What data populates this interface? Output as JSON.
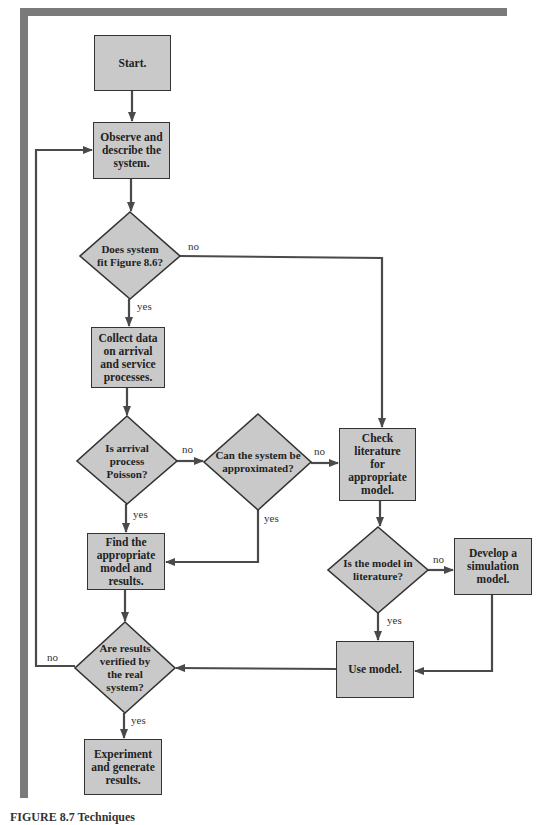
{
  "diagram": {
    "type": "flowchart",
    "colors": {
      "frame": "#7a7a7a",
      "node_fill": "#c9c9c9",
      "node_border": "#333333",
      "arrow": "#4a4a4a"
    },
    "nodes": {
      "start": "Start.",
      "observe": "Observe and describe the system.",
      "fit_figure": "Does system fit Figure 8.6?",
      "collect": "Collect data on arrival and service processes.",
      "poisson": "Is arrival process Poisson?",
      "approximate": "Can the system be approximated?",
      "check_lit": "Check literature for appropriate model.",
      "find_model": "Find the appropriate model and results.",
      "in_lit": "Is the model in literature?",
      "develop_sim": "Develop a simulation model.",
      "use_model": "Use model.",
      "verified": "Are results verified by the real system?",
      "experiment": "Experiment and generate results."
    },
    "edge_labels": {
      "fit_no": "no",
      "fit_yes": "yes",
      "poisson_no": "no",
      "poisson_yes": "yes",
      "approx_no": "no",
      "approx_yes": "yes",
      "inlit_no": "no",
      "inlit_yes": "yes",
      "verified_no": "no",
      "verified_yes": "yes"
    },
    "edges": [
      {
        "from": "start",
        "to": "observe"
      },
      {
        "from": "observe",
        "to": "fit_figure"
      },
      {
        "from": "fit_figure",
        "to": "collect",
        "label": "yes"
      },
      {
        "from": "fit_figure",
        "to": "check_lit",
        "label": "no"
      },
      {
        "from": "collect",
        "to": "poisson"
      },
      {
        "from": "poisson",
        "to": "find_model",
        "label": "yes"
      },
      {
        "from": "poisson",
        "to": "approximate",
        "label": "no"
      },
      {
        "from": "approximate",
        "to": "find_model",
        "label": "yes"
      },
      {
        "from": "approximate",
        "to": "check_lit",
        "label": "no"
      },
      {
        "from": "check_lit",
        "to": "in_lit"
      },
      {
        "from": "in_lit",
        "to": "use_model",
        "label": "yes"
      },
      {
        "from": "in_lit",
        "to": "develop_sim",
        "label": "no"
      },
      {
        "from": "develop_sim",
        "to": "use_model"
      },
      {
        "from": "use_model",
        "to": "verified"
      },
      {
        "from": "find_model",
        "to": "verified"
      },
      {
        "from": "verified",
        "to": "experiment",
        "label": "yes"
      },
      {
        "from": "verified",
        "to": "observe",
        "label": "no"
      }
    ]
  },
  "caption": "FIGURE 8.7 Techniques"
}
